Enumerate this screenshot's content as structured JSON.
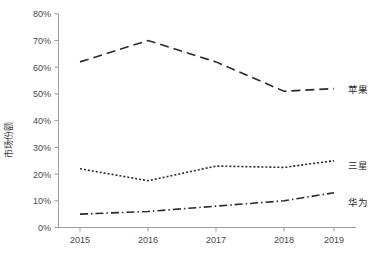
{
  "chart_data": {
    "type": "line",
    "title": "",
    "xlabel": "",
    "ylabel": "市场份额",
    "x": [
      "2015",
      "2016",
      "2017",
      "2018",
      "2019"
    ],
    "categories": [
      "2015",
      "2016",
      "2017",
      "2018",
      "2019"
    ],
    "ylim": [
      0,
      80
    ],
    "yticks": [
      "0%",
      "10%",
      "20%",
      "30%",
      "40%",
      "50%",
      "60%",
      "70%",
      "80%"
    ],
    "ytick_values": [
      0,
      10,
      20,
      30,
      40,
      50,
      60,
      70,
      80
    ],
    "grid": false,
    "legend_position": "inline-right",
    "series": [
      {
        "name": "苹果",
        "values": [
          62,
          70,
          62,
          51,
          52
        ],
        "style": "long-dash",
        "color": "#2b2b2b"
      },
      {
        "name": "三星",
        "values": [
          22,
          17.5,
          23,
          22.5,
          25
        ],
        "style": "fine-dot",
        "color": "#2b2b2b"
      },
      {
        "name": "华为",
        "values": [
          5,
          6,
          8,
          10,
          13
        ],
        "style": "dash-dot",
        "color": "#2b2b2b"
      }
    ]
  },
  "axes": {
    "y_axis_title": "市场份额",
    "y_tick_0": "0%",
    "y_tick_1": "10%",
    "y_tick_2": "20%",
    "y_tick_3": "30%",
    "y_tick_4": "40%",
    "y_tick_5": "50%",
    "y_tick_6": "60%",
    "y_tick_7": "70%",
    "y_tick_8": "80%",
    "x_tick_0": "2015",
    "x_tick_1": "2016",
    "x_tick_2": "2017",
    "x_tick_3": "2018",
    "x_tick_4": "2019"
  },
  "legend": {
    "apple": "苹果",
    "samsung": "三星",
    "huawei": "华为"
  },
  "colors": {
    "line": "#2b2b2b",
    "axis": "#9a9a9a",
    "text": "#3b3b3b",
    "background": "#ffffff"
  }
}
